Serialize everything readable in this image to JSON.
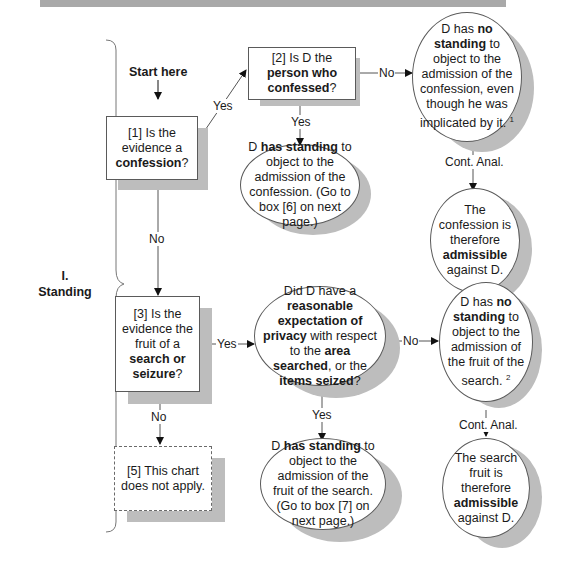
{
  "header_bar": {
    "color": "#a9a9a9"
  },
  "section": {
    "number": "I.",
    "title": "Standing"
  },
  "start": {
    "label": "Start here"
  },
  "nodes": {
    "box1": {
      "id": "[1]",
      "pre": "Is the evidence a ",
      "bold": "confession",
      "post": "?"
    },
    "box2": {
      "id": "[2]",
      "pre": "Is D the ",
      "bold": "person who confessed",
      "post": "?"
    },
    "no_standing_confession": {
      "pre": "D has ",
      "bold": "no standing",
      "post": " to object to the admission of the confession, even though he was implicated by it.",
      "footnote": "1"
    },
    "standing_confession": {
      "pre": "D ",
      "bold1": "has standing",
      "post": " to object to the admission of the confession. (Go to box [6] on next page.)"
    },
    "confession_admissible": {
      "pre": "The confession is therefore ",
      "bold": "admissible",
      "post": " against D."
    },
    "box3": {
      "id": "[3]",
      "pre": "Is the evidence the fruit of a ",
      "bold": "search or seizure",
      "post": "?"
    },
    "privacy_question": {
      "pre": "Did D have a ",
      "bold1": "reasonable expectation of privacy",
      "mid1": " with respect to the ",
      "bold2": "area searched",
      "mid2": ", or the ",
      "bold3": "items seized",
      "post": "?"
    },
    "no_standing_search": {
      "pre": "D has ",
      "bold": "no standing",
      "post": " to object to the admission of the fruit of the search.",
      "footnote": "2"
    },
    "standing_search": {
      "pre": "D ",
      "bold1": "has standing",
      "post": " to object to the admission of the fruit of the search. (Go to box [7] on next page.)"
    },
    "search_admissible": {
      "pre": "The search fruit is therefore ",
      "bold": "admissible",
      "post": " against D."
    },
    "box5": {
      "id": "[5]",
      "text": "This chart does not apply."
    }
  },
  "edge_labels": {
    "yes": "Yes",
    "no": "No",
    "cont_anal": "Cont. Anal."
  }
}
